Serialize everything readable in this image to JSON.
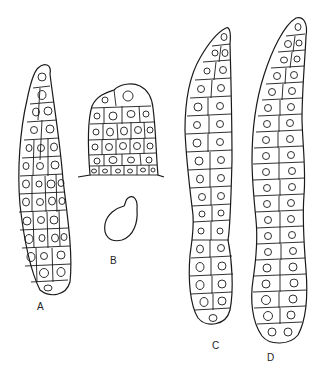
{
  "figure": {
    "panels": [
      {
        "id": "A",
        "label": "A",
        "description": "elongated club-shaped cell mass, tapering tip at top"
      },
      {
        "id": "B",
        "label": "B",
        "description": "dome-shaped cell cluster on a baseline, with a separate spore-like outline below"
      },
      {
        "id": "C",
        "label": "C",
        "description": "long slender cell column tapering to pointed tip"
      },
      {
        "id": "D",
        "label": "D",
        "description": "long sinuous cell column with rounded tip"
      }
    ],
    "colors": {
      "ink": "#1a1a1a",
      "paper": "#ffffff"
    }
  }
}
